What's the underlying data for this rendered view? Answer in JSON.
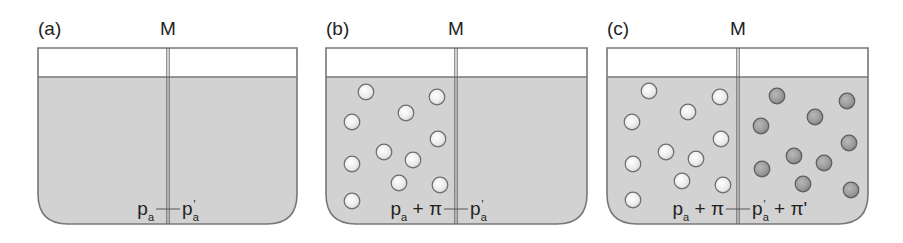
{
  "figure": {
    "colors": {
      "solution": "#d2d2d2",
      "outline": "#777777",
      "membrane": "#666666",
      "solute_light": "#f2f2f2",
      "solute_dark": "#9a9a9a",
      "text": "#222222"
    },
    "panels": [
      {
        "id": "a",
        "label": "(a)",
        "membrane_label": "M",
        "x": 38,
        "top": 48,
        "surface": 77,
        "bottom": 224,
        "right": 297,
        "membrane_x": 168,
        "left_pressure": {
          "base": "p",
          "sub": "a",
          "prime": "",
          "extra": ""
        },
        "right_pressure": {
          "base": "p",
          "sub": "a",
          "prime": "'",
          "extra": ""
        },
        "left_solutes": [],
        "right_solutes": []
      },
      {
        "id": "b",
        "label": "(b)",
        "membrane_label": "M",
        "x": 326,
        "top": 48,
        "surface": 77,
        "bottom": 224,
        "right": 587,
        "membrane_x": 456,
        "left_pressure": {
          "base": "p",
          "sub": "a",
          "prime": "",
          "extra": " + π"
        },
        "right_pressure": {
          "base": "p",
          "sub": "a",
          "prime": "'",
          "extra": ""
        },
        "left_solutes": [
          [
            366,
            92
          ],
          [
            437,
            97
          ],
          [
            406,
            113
          ],
          [
            352,
            122
          ],
          [
            438,
            139
          ],
          [
            384,
            152
          ],
          [
            413,
            160
          ],
          [
            352,
            164
          ],
          [
            399,
            183
          ],
          [
            440,
            185
          ],
          [
            352,
            201
          ]
        ],
        "right_solutes": []
      },
      {
        "id": "c",
        "label": "(c)",
        "membrane_label": "M",
        "x": 607,
        "top": 48,
        "surface": 77,
        "bottom": 224,
        "right": 868,
        "membrane_x": 738,
        "left_pressure": {
          "base": "p",
          "sub": "a",
          "prime": "",
          "extra": " + π"
        },
        "right_pressure": {
          "base": "p",
          "sub": "a",
          "prime": "'",
          "extra": " + π'"
        },
        "left_solutes": [
          [
            649,
            91
          ],
          [
            720,
            97
          ],
          [
            688,
            112
          ],
          [
            632,
            122
          ],
          [
            721,
            139
          ],
          [
            666,
            152
          ],
          [
            696,
            159
          ],
          [
            633,
            164
          ],
          [
            682,
            181
          ],
          [
            723,
            185
          ],
          [
            633,
            200
          ]
        ],
        "right_solutes": [
          [
            777,
            96
          ],
          [
            847,
            101
          ],
          [
            815,
            117
          ],
          [
            761,
            126
          ],
          [
            849,
            143
          ],
          [
            794,
            156
          ],
          [
            824,
            163
          ],
          [
            762,
            169
          ],
          [
            803,
            184
          ],
          [
            851,
            190
          ]
        ]
      }
    ]
  }
}
